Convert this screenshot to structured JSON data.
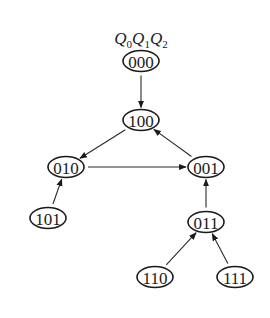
{
  "diagram": {
    "type": "state-transition-graph",
    "header": {
      "variables": [
        {
          "name": "Q",
          "sub": "0"
        },
        {
          "name": "Q",
          "sub": "1"
        },
        {
          "name": "Q",
          "sub": "2"
        }
      ]
    },
    "nodes": [
      {
        "id": "000",
        "label": "000",
        "x": 141,
        "y": 61
      },
      {
        "id": "100",
        "label": "100",
        "x": 141,
        "y": 120
      },
      {
        "id": "010",
        "label": "010",
        "x": 66,
        "y": 167
      },
      {
        "id": "001",
        "label": "001",
        "x": 206,
        "y": 167
      },
      {
        "id": "101",
        "label": "101",
        "x": 48,
        "y": 218
      },
      {
        "id": "011",
        "label": "011",
        "x": 206,
        "y": 222
      },
      {
        "id": "110",
        "label": "110",
        "x": 155,
        "y": 277
      },
      {
        "id": "111",
        "label": "111",
        "x": 235,
        "y": 277
      }
    ],
    "edges": [
      {
        "from": "000",
        "to": "100"
      },
      {
        "from": "100",
        "to": "010"
      },
      {
        "from": "010",
        "to": "001"
      },
      {
        "from": "001",
        "to": "100"
      },
      {
        "from": "101",
        "to": "010"
      },
      {
        "from": "011",
        "to": "001"
      },
      {
        "from": "110",
        "to": "011"
      },
      {
        "from": "111",
        "to": "011"
      }
    ],
    "colors": {
      "stroke": "#1a1a1a",
      "background": "#ffffff"
    }
  }
}
